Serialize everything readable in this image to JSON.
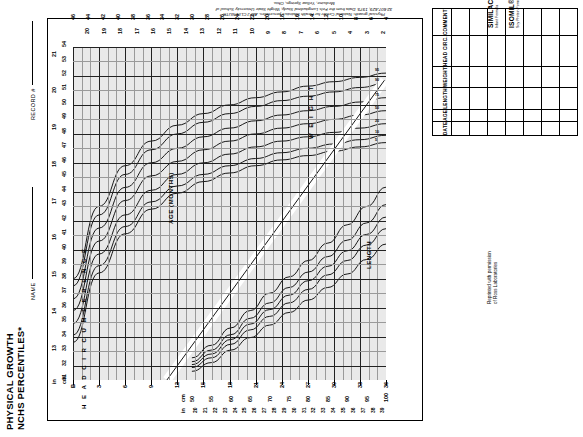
{
  "document": {
    "title_line1": "PHYSICAL GROWTH",
    "title_line2": "NCHS PERCENTILES*",
    "name_label": "NAME",
    "record_label": "RECORD #"
  },
  "citation": {
    "text": "*Adapted from: Hamill PVV, Drizd TA, Johnson CL, Reed RB, Roche AF, Moore WM: Physical growth: National Center for Health Statistics percentiles. AM J CLIN NUTR 32:607-629, 1979. Data from the Fels Longitudinal Study, Wright State University School of Medicine, Yellow Springs, Ohio."
  },
  "products": {
    "items": [
      {
        "name": "SIMILAC® WITH IRON",
        "desc": "Infant Formula"
      },
      {
        "name": "ISOMIL®",
        "desc": "Soy Protein Formula with Iron"
      }
    ],
    "permission_line1": "Reprinted with permission",
    "permission_line2": "of Ross Laboratories"
  },
  "chart_data": {
    "type": "line",
    "title": "PHYSICAL GROWTH NCHS PERCENTILES*",
    "xlabel": "AGE (MONTHS)",
    "ylabel_left": "HEAD CIRCUMFERENCE",
    "ylabel_right": "WEIGHT",
    "ylabel_bottom": "LENGTH",
    "grid": true,
    "legend_position": "inline-curve-labels",
    "axes": {
      "age_months": {
        "label": "AGE (MONTHS)",
        "ticks": [
          0,
          3,
          6,
          9,
          12,
          15,
          18,
          21,
          24,
          27,
          30,
          33,
          36
        ],
        "tick_labels": [
          "B",
          "3",
          "6",
          "9",
          "12",
          "15",
          "18",
          "21",
          "24",
          "27",
          "30",
          "33",
          "36"
        ],
        "range": [
          0,
          36
        ]
      },
      "head_circumference_cm": {
        "label": "cm",
        "ticks": [
          31,
          32,
          33,
          34,
          35,
          36,
          37,
          38,
          39,
          40,
          41,
          42,
          43,
          44,
          45,
          46,
          47,
          48,
          49,
          50,
          51,
          52,
          53,
          54
        ],
        "range": [
          31,
          54
        ]
      },
      "head_circumference_in": {
        "label": "in",
        "ticks": [
          12,
          13,
          14,
          15,
          16,
          17,
          18,
          19,
          20,
          21
        ],
        "range": [
          12,
          21
        ]
      },
      "length_cm": {
        "label": "cm",
        "ticks": [
          50,
          55,
          60,
          65,
          70,
          75,
          80,
          85,
          90,
          95,
          100
        ],
        "range": [
          50,
          100
        ]
      },
      "length_in": {
        "label": "in",
        "ticks": [
          19,
          20,
          21,
          22,
          23,
          24,
          25,
          26,
          27,
          28,
          29,
          30,
          31,
          32,
          33,
          34,
          35,
          36,
          37,
          38,
          39,
          40
        ],
        "range": [
          19,
          40
        ]
      },
      "weight_lb": {
        "label": "lb",
        "ticks": [
          4,
          6,
          8,
          10,
          12,
          14,
          16,
          18,
          20,
          22,
          24,
          26,
          28,
          30,
          32,
          34,
          36,
          38,
          40,
          42,
          44,
          46
        ],
        "range": [
          4,
          46
        ]
      },
      "weight_kg": {
        "label": "kg",
        "ticks": [
          2,
          3,
          4,
          5,
          6,
          7,
          8,
          9,
          10,
          11,
          12,
          13,
          14,
          15,
          16,
          17,
          18,
          19,
          20,
          21
        ],
        "range": [
          2,
          21
        ]
      }
    },
    "percentile_labels": [
      "95",
      "90",
      "75",
      "50",
      "25",
      "10",
      "5"
    ],
    "series": [
      {
        "name": "Head circumference 95th percentile",
        "percentile": 95,
        "x": [
          0,
          3,
          6,
          9,
          12,
          15,
          18,
          21,
          24,
          27,
          30,
          33,
          36
        ],
        "values": [
          38.0,
          43.0,
          45.8,
          47.5,
          48.6,
          49.4,
          50.0,
          50.5,
          50.9,
          51.3,
          51.6,
          51.9,
          52.2
        ]
      },
      {
        "name": "Head circumference 90th percentile",
        "percentile": 90,
        "x": [
          0,
          3,
          6,
          9,
          12,
          15,
          18,
          21,
          24,
          27,
          30,
          33,
          36
        ],
        "values": [
          37.5,
          42.4,
          45.2,
          46.9,
          48.0,
          48.8,
          49.4,
          49.9,
          50.3,
          50.6,
          50.9,
          51.2,
          51.5
        ]
      },
      {
        "name": "Head circumference 75th percentile",
        "percentile": 75,
        "x": [
          0,
          3,
          6,
          9,
          12,
          15,
          18,
          21,
          24,
          27,
          30,
          33,
          36
        ],
        "values": [
          36.6,
          41.5,
          44.3,
          46.0,
          47.0,
          47.8,
          48.4,
          48.9,
          49.3,
          49.6,
          49.9,
          50.2,
          50.5
        ]
      },
      {
        "name": "Head circumference 50th percentile",
        "percentile": 50,
        "x": [
          0,
          3,
          6,
          9,
          12,
          15,
          18,
          21,
          24,
          27,
          30,
          33,
          36
        ],
        "values": [
          35.8,
          40.6,
          43.4,
          45.1,
          46.1,
          46.9,
          47.5,
          48.0,
          48.4,
          48.7,
          49.0,
          49.3,
          49.6
        ]
      },
      {
        "name": "Head circumference 25th percentile",
        "percentile": 25,
        "x": [
          0,
          3,
          6,
          9,
          12,
          15,
          18,
          21,
          24,
          27,
          30,
          33,
          36
        ],
        "values": [
          34.9,
          39.7,
          42.4,
          44.1,
          45.2,
          46.0,
          46.6,
          47.1,
          47.5,
          47.8,
          48.1,
          48.4,
          48.7
        ]
      },
      {
        "name": "Head circumference 10th percentile",
        "percentile": 10,
        "x": [
          0,
          3,
          6,
          9,
          12,
          15,
          18,
          21,
          24,
          27,
          30,
          33,
          36
        ],
        "values": [
          34.1,
          38.9,
          41.6,
          43.3,
          44.4,
          45.2,
          45.8,
          46.3,
          46.7,
          47.0,
          47.3,
          47.6,
          47.9
        ]
      },
      {
        "name": "Head circumference 5th percentile",
        "percentile": 5,
        "x": [
          0,
          3,
          6,
          9,
          12,
          15,
          18,
          21,
          24,
          27,
          30,
          33,
          36
        ],
        "values": [
          33.6,
          38.4,
          41.1,
          42.8,
          43.9,
          44.7,
          45.3,
          45.8,
          46.2,
          46.5,
          46.8,
          47.1,
          47.4
        ]
      },
      {
        "name": "Weight-for-length 95th percentile",
        "percentile": 95,
        "x_length_cm": [
          50,
          55,
          60,
          65,
          70,
          75,
          80,
          85,
          90,
          95,
          100
        ],
        "values_kg": [
          4.3,
          5.6,
          7.4,
          9.2,
          11.0,
          12.7,
          14.4,
          16.2,
          18.1,
          20.0,
          22.0
        ]
      },
      {
        "name": "Weight-for-length 75th percentile",
        "percentile": 75,
        "x_length_cm": [
          50,
          55,
          60,
          65,
          70,
          75,
          80,
          85,
          90,
          95,
          100
        ],
        "values_kg": [
          3.9,
          5.1,
          6.7,
          8.4,
          10.0,
          11.6,
          13.2,
          14.8,
          16.5,
          18.3,
          20.2
        ]
      },
      {
        "name": "Weight-for-length 50th percentile",
        "percentile": 50,
        "x_length_cm": [
          50,
          55,
          60,
          65,
          70,
          75,
          80,
          85,
          90,
          95,
          100
        ],
        "values_kg": [
          3.6,
          4.7,
          6.2,
          7.8,
          9.3,
          10.8,
          12.3,
          13.8,
          15.4,
          17.1,
          18.9
        ]
      },
      {
        "name": "Weight-for-length 25th percentile",
        "percentile": 25,
        "x_length_cm": [
          50,
          55,
          60,
          65,
          70,
          75,
          80,
          85,
          90,
          95,
          100
        ],
        "values_kg": [
          3.3,
          4.3,
          5.7,
          7.2,
          8.6,
          10.0,
          11.4,
          12.9,
          14.4,
          16.0,
          17.7
        ]
      },
      {
        "name": "Weight-for-length 5th percentile",
        "percentile": 5,
        "x_length_cm": [
          50,
          55,
          60,
          65,
          70,
          75,
          80,
          85,
          90,
          95,
          100
        ],
        "values_kg": [
          2.9,
          3.8,
          5.1,
          6.4,
          7.7,
          9.0,
          10.3,
          11.6,
          13.0,
          14.5,
          16.1
        ]
      }
    ]
  },
  "record_table": {
    "columns": [
      "DATE",
      "AGE",
      "LENGTH",
      "WEIGHT",
      "HEAD CIRC.",
      "COMMENT"
    ],
    "rows": 7
  }
}
